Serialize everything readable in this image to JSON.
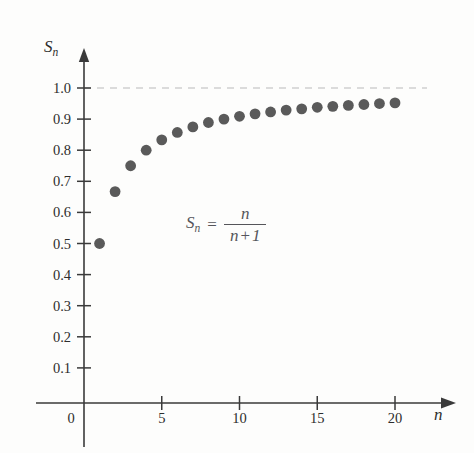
{
  "figure": {
    "background_color": "#fdfdfc",
    "point_color": "#5a5a5a",
    "axis_color": "#3a3a3a",
    "limit_line_color": "#b9b9b9",
    "formula_color": "#55555a"
  },
  "annotation": {
    "formula_lhs": "S",
    "formula_lhs_sub": "n",
    "formula_equals": "=",
    "formula_numerator": "n",
    "formula_denominator_left": "n",
    "formula_denominator_op": "+",
    "formula_denominator_right": "1",
    "formula_plain": "S_n = n / (n + 1)"
  },
  "axes": {
    "y_axis_name": "S",
    "y_axis_name_sub": "n",
    "x_axis_name": "n",
    "y_ticks": [
      "1.0",
      "0.9",
      "0.8",
      "0.7",
      "0.6",
      "0.5",
      "0.4",
      "0.3",
      "0.2",
      "0.1"
    ],
    "x_ticks": [
      "0",
      "5",
      "10",
      "15",
      "20"
    ]
  },
  "chart_data": {
    "type": "scatter",
    "title": "",
    "subtitle": "",
    "xlabel": "n",
    "ylabel": "S_n",
    "annotation": "S_n = n/(n + 1)",
    "grid": false,
    "legend": null,
    "xlim": [
      0,
      22
    ],
    "ylim": [
      0,
      1.05
    ],
    "x_tick_values": [
      0,
      5,
      10,
      15,
      20
    ],
    "y_tick_values": [
      0.1,
      0.2,
      0.3,
      0.4,
      0.5,
      0.6,
      0.7,
      0.8,
      0.9,
      1.0
    ],
    "asymptote": {
      "y": 1.0,
      "style": "dashed",
      "label": ""
    },
    "series": [
      {
        "name": "S_n = n/(n+1)",
        "marker": "circle",
        "color": "#5a5a5a",
        "x": [
          1,
          2,
          3,
          4,
          5,
          6,
          7,
          8,
          9,
          10,
          11,
          12,
          13,
          14,
          15,
          16,
          17,
          18,
          19,
          20
        ],
        "y": [
          0.5,
          0.667,
          0.75,
          0.8,
          0.833,
          0.857,
          0.875,
          0.889,
          0.9,
          0.909,
          0.917,
          0.923,
          0.929,
          0.933,
          0.938,
          0.941,
          0.944,
          0.947,
          0.95,
          0.952
        ]
      }
    ]
  }
}
